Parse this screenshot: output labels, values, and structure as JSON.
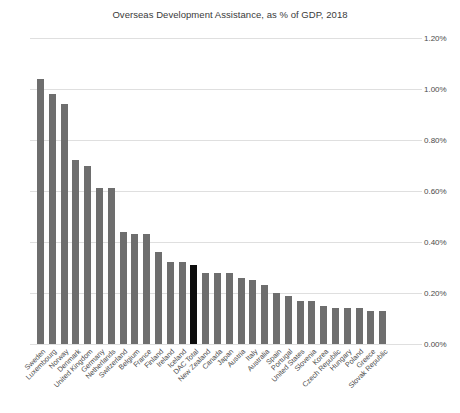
{
  "chart_data": {
    "type": "bar",
    "title": "Overseas Development Assistance, as % of GDP, 2018",
    "xlabel": "",
    "ylabel": "",
    "ylim": [
      0.0,
      1.2
    ],
    "ytick_labels": [
      "0.00%",
      "0.20%",
      "0.40%",
      "0.60%",
      "0.80%",
      "1.00%",
      "1.20%"
    ],
    "ytick_values": [
      0.0,
      0.2,
      0.4,
      0.6,
      0.8,
      1.0,
      1.2
    ],
    "grid": true,
    "legend": null,
    "value_suffix": "%",
    "bar_color": "#6e6e6e",
    "highlight_color": "#0d0d0d",
    "highlight_category": "DAC Total",
    "categories": [
      "Sweden",
      "Luxembourg",
      "Norway",
      "Denmark",
      "United Kingdom",
      "Germany",
      "Netherlands",
      "Switzerland",
      "Belgium",
      "France",
      "Finland",
      "Ireland",
      "Iceland",
      "DAC Total",
      "New Zealand",
      "Canada",
      "Japan",
      "Austria",
      "Italy",
      "Australia",
      "Spain",
      "Portugal",
      "United States",
      "Slovenia",
      "Korea",
      "Czech Republic",
      "Hungary",
      "Poland",
      "Greece",
      "Slovak Republic"
    ],
    "values": [
      1.04,
      0.98,
      0.94,
      0.72,
      0.7,
      0.61,
      0.61,
      0.44,
      0.43,
      0.43,
      0.36,
      0.32,
      0.32,
      0.31,
      0.28,
      0.28,
      0.28,
      0.26,
      0.25,
      0.23,
      0.2,
      0.19,
      0.17,
      0.17,
      0.15,
      0.14,
      0.14,
      0.14,
      0.13,
      0.13
    ]
  }
}
